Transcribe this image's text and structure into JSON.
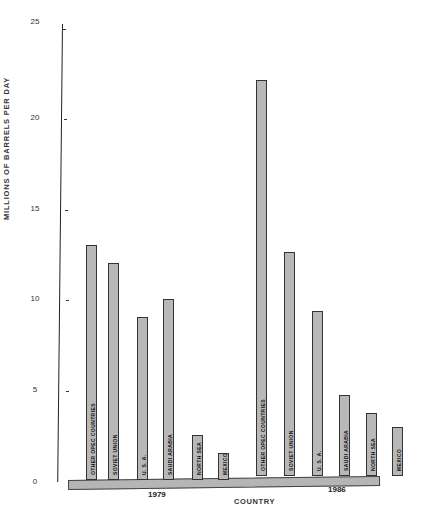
{
  "chart_data": {
    "type": "bar",
    "title": "",
    "xlabel": "COUNTRY",
    "ylabel": "MILLIONS OF BARRELS PER DAY",
    "ylim": [
      0,
      25
    ],
    "yticks": [
      0,
      5,
      10,
      15,
      20,
      25
    ],
    "grid": false,
    "groups": [
      "1979",
      "1986"
    ],
    "categories": [
      "OTHER OPEC COUNTRIES",
      "SOVIET UNION",
      "U. S. A.",
      "SAUDI ARABIA",
      "NORTH SEA",
      "MEXICO"
    ],
    "series": [
      {
        "name": "1979",
        "values": [
          13.0,
          12.0,
          9.0,
          10.0,
          2.5,
          1.5
        ]
      },
      {
        "name": "1986",
        "values": [
          21.9,
          12.4,
          9.1,
          4.5,
          3.5,
          2.7
        ]
      }
    ]
  },
  "axis": {
    "ticks": [
      "0",
      "5",
      "10",
      "15",
      "20",
      "25"
    ]
  }
}
